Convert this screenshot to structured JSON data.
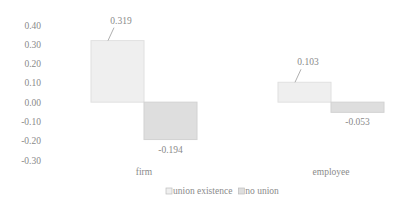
{
  "chart_data": {
    "type": "bar",
    "title": "",
    "xlabel": "",
    "ylabel": "",
    "categories": [
      "firm",
      "employee"
    ],
    "series": [
      {
        "name": "union existence",
        "values": [
          0.319,
          0.103
        ],
        "labels": [
          "0.319",
          "0.103"
        ],
        "color": "#efefef",
        "stroke": "#e0e0e0"
      },
      {
        "name": "no union",
        "values": [
          -0.194,
          -0.053
        ],
        "labels": [
          "-0.194",
          "-0.053"
        ],
        "color": "#dedede",
        "stroke": "#d2d2d2"
      }
    ],
    "ylim": [
      -0.3,
      0.4
    ],
    "yticks": [
      0.4,
      0.3,
      0.2,
      0.1,
      0.0,
      -0.1,
      -0.2,
      -0.3
    ],
    "ytick_labels": [
      "0.40",
      "0.30",
      "0.20",
      "0.10",
      "0.00",
      "-0.10",
      "-0.20",
      "-0.30"
    ],
    "grid": false,
    "legend": {
      "position": "bottom",
      "entries": [
        "union existence",
        "no union"
      ]
    }
  }
}
